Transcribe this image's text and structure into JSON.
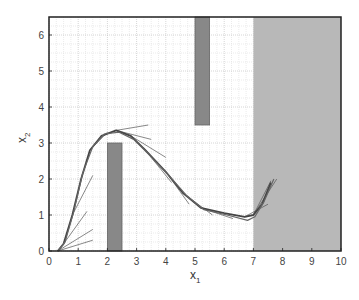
{
  "chart_data": {
    "type": "line",
    "title": "",
    "xlabel": "x",
    "xlabel_sub": "1",
    "ylabel": "x",
    "ylabel_sub": "2",
    "xlim": [
      0,
      10
    ],
    "ylim": [
      0,
      6.5
    ],
    "xticks": [
      0,
      1,
      2,
      3,
      4,
      5,
      6,
      7,
      8,
      9,
      10
    ],
    "yticks": [
      0,
      1,
      2,
      3,
      4,
      5,
      6
    ],
    "grid": true,
    "minor_grid_step": 0.25,
    "legend": null,
    "regions": [
      {
        "name": "lower-obstacle",
        "x": [
          2.0,
          2.5
        ],
        "y": [
          0,
          3.0
        ],
        "color": "#888888"
      },
      {
        "name": "upper-obstacle",
        "x": [
          5.0,
          5.5
        ],
        "y": [
          3.5,
          6.5
        ],
        "color": "#888888"
      },
      {
        "name": "shaded-goal-region",
        "x": [
          7.0,
          10.0
        ],
        "y": [
          0,
          6.5
        ],
        "color": "#b8b8b8"
      }
    ],
    "series": [
      {
        "name": "trajectory-1",
        "x": [
          0.3,
          0.5,
          0.8,
          1.1,
          1.4,
          1.8,
          2.3,
          2.8,
          3.3,
          4.0,
          4.6,
          5.2,
          6.0,
          6.7,
          7.0,
          7.3,
          7.6
        ],
        "y": [
          0.0,
          0.2,
          1.0,
          2.0,
          2.8,
          3.2,
          3.35,
          3.2,
          2.8,
          2.2,
          1.6,
          1.2,
          1.05,
          0.95,
          1.0,
          1.3,
          1.9
        ]
      },
      {
        "name": "trajectory-2",
        "x": [
          0.3,
          0.55,
          0.85,
          1.15,
          1.5,
          1.9,
          2.4,
          2.9,
          3.4,
          4.1,
          4.7,
          5.3,
          6.1,
          6.8,
          7.05,
          7.35,
          7.7
        ],
        "y": [
          0.0,
          0.25,
          1.1,
          2.15,
          2.9,
          3.25,
          3.3,
          3.1,
          2.7,
          2.1,
          1.55,
          1.15,
          1.0,
          0.85,
          0.95,
          1.35,
          2.0
        ]
      }
    ],
    "tangents": [
      {
        "x": [
          0.3,
          1.5
        ],
        "y": [
          0.0,
          0.3
        ]
      },
      {
        "x": [
          0.3,
          1.5
        ],
        "y": [
          0.0,
          0.6
        ]
      },
      {
        "x": [
          0.5,
          1.3
        ],
        "y": [
          0.2,
          1.1
        ]
      },
      {
        "x": [
          0.8,
          1.5
        ],
        "y": [
          1.0,
          2.1
        ]
      },
      {
        "x": [
          1.4,
          2.0
        ],
        "y": [
          2.8,
          3.3
        ]
      },
      {
        "x": [
          2.3,
          3.4
        ],
        "y": [
          3.35,
          3.5
        ]
      },
      {
        "x": [
          2.3,
          3.5
        ],
        "y": [
          3.35,
          3.1
        ]
      },
      {
        "x": [
          2.8,
          4.0
        ],
        "y": [
          3.2,
          2.6
        ]
      },
      {
        "x": [
          3.3,
          4.2
        ],
        "y": [
          2.8,
          1.9
        ]
      },
      {
        "x": [
          4.0,
          4.8
        ],
        "y": [
          2.2,
          1.3
        ]
      },
      {
        "x": [
          4.6,
          5.6
        ],
        "y": [
          1.6,
          1.0
        ]
      },
      {
        "x": [
          5.2,
          6.3
        ],
        "y": [
          1.2,
          0.9
        ]
      },
      {
        "x": [
          6.7,
          7.5
        ],
        "y": [
          0.95,
          1.3
        ]
      },
      {
        "x": [
          7.0,
          7.6
        ],
        "y": [
          1.0,
          1.95
        ]
      },
      {
        "x": [
          7.0,
          7.8
        ],
        "y": [
          1.0,
          2.0
        ]
      }
    ]
  }
}
